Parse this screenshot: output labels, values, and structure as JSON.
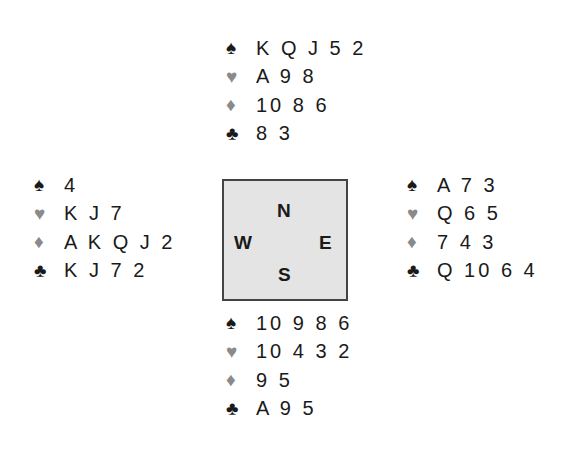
{
  "suits": {
    "spades": "♠",
    "hearts": "♥",
    "diamonds": "♦",
    "clubs": "♣"
  },
  "colors": {
    "black_suit": "#1a1a1a",
    "red_suit": "#8a8a8a",
    "compass_bg": "#e4e4e4",
    "compass_border": "#444444"
  },
  "compass": {
    "north": "N",
    "south": "S",
    "east": "E",
    "west": "W"
  },
  "hands": {
    "north": {
      "spades": "K Q J 5 2",
      "hearts": "A 9 8",
      "diamonds": "10 8 6",
      "clubs": "8 3"
    },
    "west": {
      "spades": "4",
      "hearts": "K J 7",
      "diamonds": "A K Q J 2",
      "clubs": "K J 7 2"
    },
    "east": {
      "spades": "A 7 3",
      "hearts": "Q 6 5",
      "diamonds": "7 4 3",
      "clubs": "Q 10 6 4"
    },
    "south": {
      "spades": "10 9 8 6",
      "hearts": "10 4 3 2",
      "diamonds": "9 5",
      "clubs": "A 9 5"
    }
  }
}
